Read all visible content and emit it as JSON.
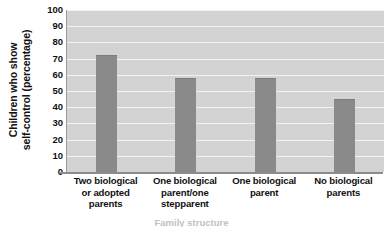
{
  "chart_data": {
    "type": "bar",
    "title": "",
    "xlabel": "Family structure",
    "ylabel": "Children who show self-control (percentage)",
    "ylabel_line1": "Children who show",
    "ylabel_line2": "self-control (percentage)",
    "categories": [
      "Two biological or adopted parents",
      "One biological parent/one stepparent",
      "One biological parent",
      "No biological parents"
    ],
    "category_lines": [
      [
        "Two biological",
        "or adopted",
        "parents"
      ],
      [
        "One biological",
        "parent/one",
        "stepparent"
      ],
      [
        "One biological",
        "parent"
      ],
      [
        "No biological",
        "parents"
      ]
    ],
    "values": [
      72,
      58,
      58,
      45
    ],
    "ylim": [
      0,
      100
    ],
    "ytick_values": [
      100,
      90,
      80,
      70,
      60,
      50,
      40,
      30,
      20,
      10,
      0
    ],
    "grid": true,
    "legend": "none",
    "colors": {
      "bar": "#8a8a8a",
      "plot_background": "#d3d3d3",
      "gridline": "#f2f2f2",
      "axis": "#8c8c8c",
      "text": "#111111"
    }
  }
}
